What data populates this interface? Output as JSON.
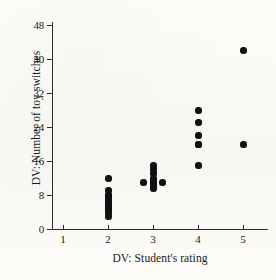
{
  "chart_data": {
    "type": "scatter",
    "title": "",
    "xlabel": "DV:  Student's rating",
    "ylabel": "DV:  Number of toy switches",
    "xlim": [
      0.5,
      5.6
    ],
    "ylim": [
      0,
      50
    ],
    "grid": false,
    "legend": null,
    "xticks": [
      1,
      2,
      3,
      4,
      5
    ],
    "xtick_labels": [
      "1",
      "2",
      "3",
      "4",
      "5"
    ],
    "yticks": [
      0,
      8,
      16,
      24,
      32,
      40,
      48
    ],
    "ytick_labels": [
      "0",
      "8",
      "16",
      "24",
      "32",
      "40",
      "48"
    ],
    "marker": "filled-circle",
    "marker_color": "#111111",
    "points": [
      {
        "x": 2,
        "y": 12
      },
      {
        "x": 2,
        "y": 9
      },
      {
        "x": 2,
        "y": 8
      },
      {
        "x": 2,
        "y": 8
      },
      {
        "x": 2,
        "y": 7.5
      },
      {
        "x": 2,
        "y": 7
      },
      {
        "x": 2,
        "y": 6.5
      },
      {
        "x": 2,
        "y": 6
      },
      {
        "x": 2,
        "y": 5.5
      },
      {
        "x": 2,
        "y": 5
      },
      {
        "x": 2,
        "y": 4.5
      },
      {
        "x": 2,
        "y": 4
      },
      {
        "x": 2,
        "y": 3
      },
      {
        "x": 3,
        "y": 15
      },
      {
        "x": 3,
        "y": 14
      },
      {
        "x": 3,
        "y": 13
      },
      {
        "x": 3,
        "y": 12
      },
      {
        "x": 3,
        "y": 11
      },
      {
        "x": 3,
        "y": 11
      },
      {
        "x": 3,
        "y": 11
      },
      {
        "x": 3,
        "y": 10
      },
      {
        "x": 3,
        "y": 9.5
      },
      {
        "x": 2.78,
        "y": 11
      },
      {
        "x": 3.22,
        "y": 11
      },
      {
        "x": 4,
        "y": 28
      },
      {
        "x": 4,
        "y": 25
      },
      {
        "x": 4,
        "y": 22
      },
      {
        "x": 4,
        "y": 20
      },
      {
        "x": 4,
        "y": 20
      },
      {
        "x": 4,
        "y": 15
      },
      {
        "x": 5,
        "y": 42
      },
      {
        "x": 5,
        "y": 20
      }
    ]
  },
  "axes": {
    "y_title": "DV:  Number of toy switches",
    "x_title": "DV:  Student's rating"
  }
}
